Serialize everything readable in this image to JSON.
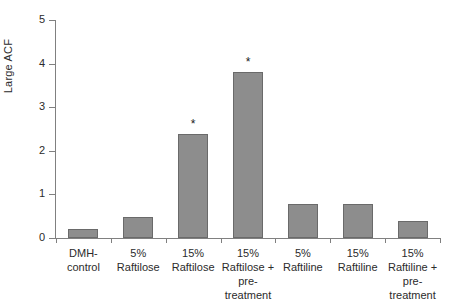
{
  "chart_data": {
    "type": "bar",
    "title": "",
    "xlabel": "",
    "ylabel": "Large ACF",
    "ylim": [
      0,
      5
    ],
    "yticks": [
      0,
      1,
      2,
      3,
      4,
      5
    ],
    "ytick_labels": [
      "0",
      "1",
      "2",
      "3",
      "4",
      "5"
    ],
    "grid": false,
    "legend": "none",
    "bar_color": "#8d8d8d",
    "bar_edge_color": "#6a6a6a",
    "categories": [
      "DMH-\ncontrol",
      "5%\nRaftilose",
      "15%\nRaftilose",
      "15%\nRaftilose +\npre-\ntreatment",
      "5%\nRaftiline",
      "15%\nRaftiline",
      "15%\nRaftiline +\npre-\ntreatment"
    ],
    "values": [
      0.2,
      0.48,
      2.38,
      3.8,
      0.78,
      0.78,
      0.4
    ],
    "annotations": [
      {
        "category_index": 2,
        "text": "*"
      },
      {
        "category_index": 3,
        "text": "*"
      }
    ]
  }
}
